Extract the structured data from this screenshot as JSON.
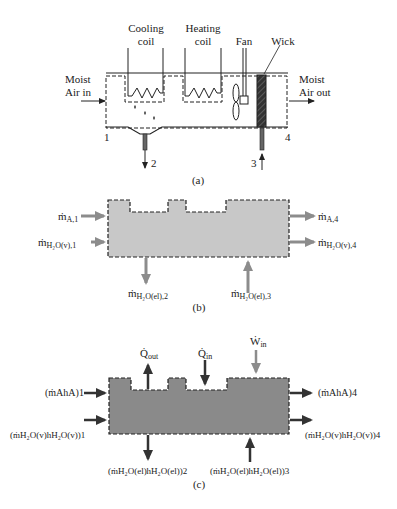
{
  "figure": {
    "panel_a": {
      "caption": "(a)",
      "labels": {
        "cooling_coil_line1": "Cooling",
        "cooling_coil_line2": "coil",
        "heating_coil_line1": "Heating",
        "heating_coil_line2": "coil",
        "fan": "Fan",
        "wick": "Wick",
        "inlet_line1": "Moist",
        "inlet_line2": "Air in",
        "outlet_line1": "Moist",
        "outlet_line2": "Air out"
      },
      "state_points": [
        "1",
        "2",
        "3",
        "4"
      ]
    },
    "panel_b": {
      "caption": "(b)",
      "flows": {
        "in_air_1": {
          "sym": "ṁ",
          "sub": "A,1"
        },
        "in_vapor_1": {
          "sym": "ṁ",
          "sub": "H₂O(v),1"
        },
        "out_air_4": {
          "sym": "ṁ",
          "sub": "A,4"
        },
        "out_vapor_4": {
          "sym": "ṁ",
          "sub": "H₂O(v),4"
        },
        "out_liquid_2": {
          "sym": "ṁ",
          "sub": "H₂O(el),2"
        },
        "in_liquid_3": {
          "sym": "ṁ",
          "sub": "H₂O(el),3"
        }
      },
      "colors": {
        "fill": "#c8c8c8",
        "arrow": "#8c8c8c",
        "border": "#222222"
      }
    },
    "panel_c": {
      "caption": "(c)",
      "energy": {
        "q_out": {
          "sym": "Q̇",
          "sub": "out"
        },
        "q_in": {
          "sym": "Q̇",
          "sub": "in"
        },
        "w_in": {
          "sym": "Ẇ",
          "sub": "in"
        }
      },
      "flows": {
        "in_air_1": "(ṁAhA)1",
        "in_vapor_1": "(ṁH₂O(v)hH₂O(v))1",
        "out_air_4": "(ṁAhA)4",
        "out_vapor_4": "(ṁH₂O(v)hH₂O(v))4",
        "out_liquid_2": "(ṁH₂O(el)hH₂O(el))2",
        "in_liquid_3": "(ṁH₂O(el)hH₂O(el))3"
      },
      "colors": {
        "fill": "#8a8a8a",
        "arrow_dark": "#333333",
        "arrow_gray": "#8c8c8c",
        "border": "#222222"
      }
    }
  }
}
